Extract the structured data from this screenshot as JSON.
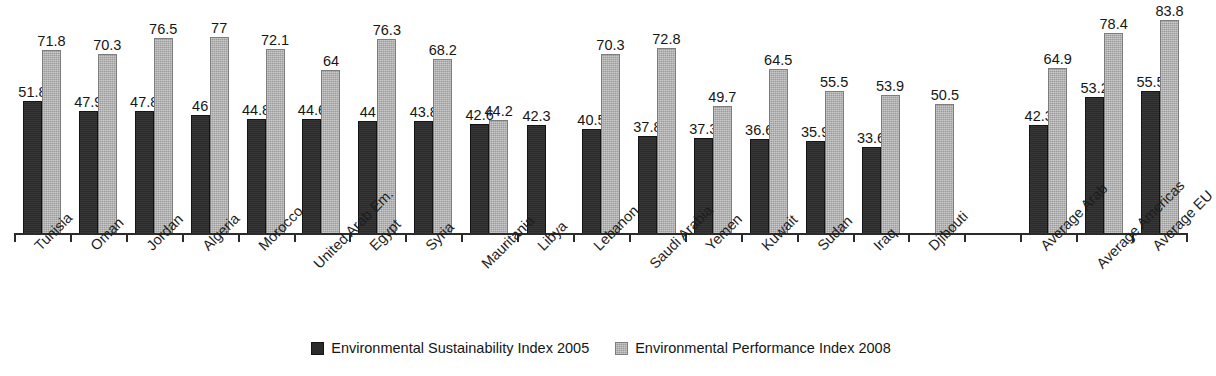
{
  "chart_data": {
    "type": "bar",
    "title": "",
    "subtitle": "",
    "xlabel": "",
    "ylabel": "",
    "ylim": [
      0,
      90
    ],
    "grid": false,
    "legend_position": "bottom",
    "categories": [
      "Tunisia",
      "Oman",
      "Jordan",
      "Algeria",
      "Morocco",
      "United Arab Em.",
      "Egypt",
      "Syria",
      "Mauritania",
      "Libya",
      "Lebanon",
      "Saudi Arabia",
      "Yemen",
      "Kuwait",
      "Sudan",
      "Iraq",
      "Djibouti",
      "",
      "Average Arab",
      "Average Americas",
      "Average EU"
    ],
    "series": [
      {
        "name": "Environmental Sustainability Index 2005",
        "color": "#2b2b2b",
        "values": [
          51.8,
          47.9,
          47.8,
          46,
          44.8,
          44.6,
          44,
          43.8,
          42.6,
          42.3,
          40.5,
          37.8,
          37.3,
          36.6,
          35.9,
          33.6,
          null,
          null,
          42.3,
          53.2,
          55.5
        ],
        "labels": [
          "51.8",
          "47.9",
          "47.8",
          "46",
          "44.8",
          "44.6",
          "44",
          "43.8",
          "42.6",
          "42.3",
          "40.5",
          "37.8",
          "37.3",
          "36.6",
          "35.9",
          "33.6",
          "",
          "",
          "42.3",
          "53.2",
          "55.5"
        ]
      },
      {
        "name": "Environmental Performance Index 2008",
        "color": "#9b9b9b",
        "values": [
          71.8,
          70.3,
          76.5,
          77,
          72.1,
          64,
          76.3,
          68.2,
          44.2,
          null,
          70.3,
          72.8,
          49.7,
          64.5,
          55.5,
          53.9,
          50.5,
          null,
          64.9,
          78.4,
          83.8
        ],
        "labels": [
          "71.8",
          "70.3",
          "76.5",
          "77",
          "72.1",
          "64",
          "76.3",
          "68.2",
          "44.2",
          "",
          "70.3",
          "72.8",
          "49.7",
          "64.5",
          "55.5",
          "53.9",
          "50.5",
          "",
          "64.9",
          "78.4",
          "83.8"
        ]
      }
    ]
  },
  "legend": {
    "items": [
      {
        "label": "Environmental Sustainability Index 2005",
        "swatch": "esi"
      },
      {
        "label": "Environmental Performance Index 2008",
        "swatch": "epi"
      }
    ]
  }
}
